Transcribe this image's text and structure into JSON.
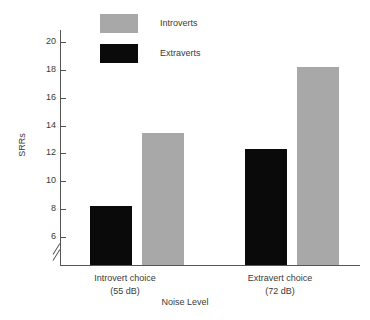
{
  "chart_data": {
    "type": "bar",
    "title": "",
    "xlabel": "Noise Level",
    "ylabel": "SRRs",
    "categories": [
      "Introvert choice\n(55 dB)",
      "Extravert choice\n(72 dB)"
    ],
    "category_lines": [
      {
        "line1": "Introvert choice",
        "line2": "(55 dB)"
      },
      {
        "line1": "Extravert choice",
        "line2": "(72 dB)"
      }
    ],
    "series": [
      {
        "name": "Extraverts",
        "color": "#0a0a0a",
        "values": [
          8.2,
          12.3
        ]
      },
      {
        "name": "Introverts",
        "color": "#a8a8a8",
        "values": [
          13.5,
          18.2
        ]
      }
    ],
    "ylim": [
      5,
      21
    ],
    "yticks": [
      6,
      8,
      10,
      12,
      14,
      16,
      18,
      20
    ],
    "ytick_labels": [
      "6",
      "8",
      "10",
      "12",
      "14",
      "16",
      "18",
      "20"
    ],
    "axis_break": true,
    "grid": false,
    "legend_position": "top-center",
    "legend": [
      {
        "label": "Introverts",
        "color": "#a8a8a8"
      },
      {
        "label": "Extraverts",
        "color": "#0a0a0a"
      }
    ]
  },
  "colors": {
    "introverts": "#a8a8a8",
    "extraverts": "#0a0a0a",
    "axis": "#555555",
    "text": "#3a3a3a",
    "background": "#ffffff"
  }
}
